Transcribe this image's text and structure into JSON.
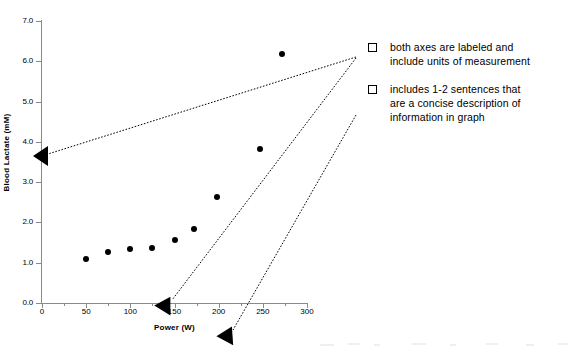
{
  "chart_data": {
    "type": "scatter",
    "title": "",
    "xlabel": "Power (W)",
    "ylabel": "Blood Lactate (mM)",
    "xlim": [
      0,
      300
    ],
    "ylim": [
      0.0,
      7.0
    ],
    "grid": false,
    "legend": "none",
    "x_ticks": [
      0,
      50,
      100,
      150,
      200,
      250,
      300
    ],
    "x_tick_labels": [
      "0",
      "50",
      "100",
      "150",
      "200",
      "250",
      "300"
    ],
    "x_minor_ticks": [
      25,
      75,
      125,
      175,
      225,
      275
    ],
    "y_ticks": [
      0.0,
      1.0,
      2.0,
      3.0,
      4.0,
      5.0,
      6.0,
      7.0
    ],
    "y_tick_labels": [
      "0.0",
      "1.0",
      "2.0",
      "3.0",
      "4.0",
      "5.0",
      "6.0",
      "7.0"
    ],
    "series": [
      {
        "name": "Blood lactate",
        "marker": "filled-circle",
        "color": "#000000",
        "x": [
          50,
          75,
          100,
          125,
          150,
          172,
          198,
          247,
          272
        ],
        "y": [
          1.1,
          1.27,
          1.33,
          1.36,
          1.57,
          1.83,
          2.62,
          3.82,
          6.18
        ]
      }
    ]
  },
  "annotations": {
    "leader_line_style": "dotted",
    "leader_line_color": "#000000",
    "arrow_targets": [
      {
        "name": "y-axis-title-arrow",
        "points_to": "Blood Lactate (mM)"
      },
      {
        "name": "x-axis-title-arrow",
        "points_to": "Power (W)"
      },
      {
        "name": "description-arrow",
        "points_to": "graph description area"
      }
    ]
  },
  "notes": {
    "items": [
      {
        "bullet": "checkbox-bullet",
        "lines": [
          "both axes are labeled and",
          "include units of measurement"
        ]
      },
      {
        "bullet": "checkbox-bullet",
        "lines": [
          "includes 1-2 sentences that",
          "are a concise description of",
          "information in graph"
        ]
      }
    ]
  },
  "colors": {
    "axis": "#8a8a8a",
    "marker": "#000000",
    "text": "#000000",
    "background": "#ffffff"
  }
}
